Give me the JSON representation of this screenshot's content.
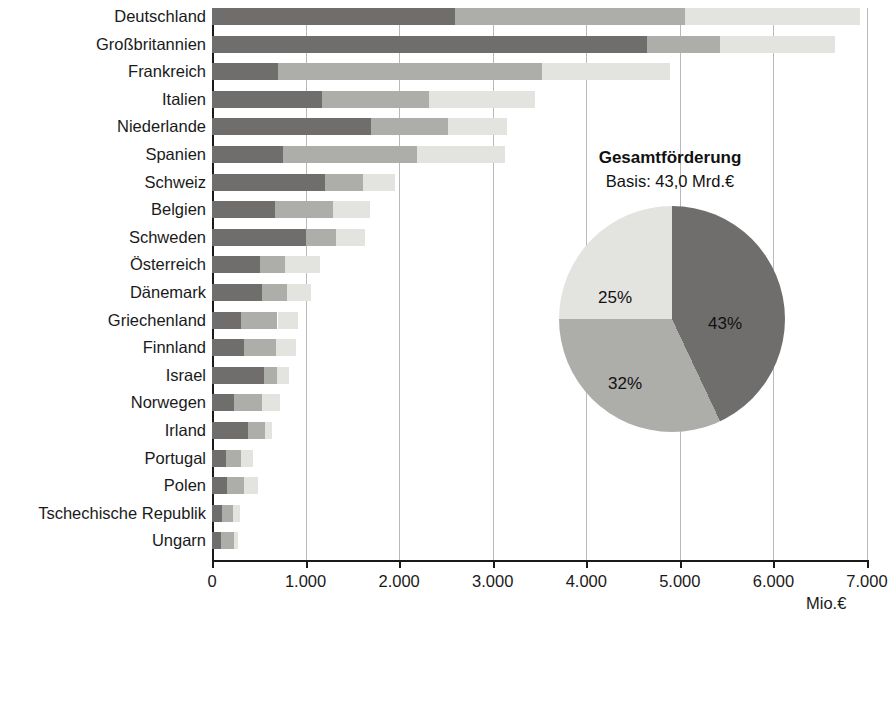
{
  "chart_data": {
    "type": "bar",
    "orientation": "horizontal",
    "stacked": true,
    "title": "",
    "xlabel": "Mio.€",
    "ylabel": "",
    "xlim": [
      0,
      7000
    ],
    "xticks": [
      0,
      1000,
      2000,
      3000,
      4000,
      5000,
      6000,
      7000
    ],
    "xtick_labels": [
      "0",
      "1.000",
      "2.000",
      "3.000",
      "4.000",
      "5.000",
      "6.000",
      "7.000"
    ],
    "grid": "vertical",
    "categories": [
      "Deutschland",
      "Großbritannien",
      "Frankreich",
      "Italien",
      "Niederlande",
      "Spanien",
      "Schweiz",
      "Belgien",
      "Schweden",
      "Österreich",
      "Dänemark",
      "Griechenland",
      "Finnland",
      "Israel",
      "Norwegen",
      "Irland",
      "Portugal",
      "Polen",
      "Tschechische Republik",
      "Ungarn"
    ],
    "series": [
      {
        "name": "Hochschulen",
        "color": "#706e6d",
        "values": [
          2600,
          4650,
          700,
          1180,
          1700,
          760,
          1210,
          675,
          1000,
          510,
          530,
          310,
          340,
          560,
          230,
          380,
          150,
          160,
          110,
          100
        ]
      },
      {
        "name": "Außeruniversitäre Einrichtungen und Personenförderung",
        "color": "#adadaa",
        "values": [
          2450,
          780,
          2830,
          1140,
          820,
          1430,
          400,
          615,
          320,
          275,
          270,
          390,
          340,
          130,
          300,
          190,
          160,
          180,
          110,
          130
        ]
      },
      {
        "name": "Industrie und Wirtschaft",
        "color": "#e3e3df",
        "values": [
          1870,
          1230,
          1360,
          1130,
          630,
          940,
          345,
          400,
          310,
          370,
          260,
          220,
          220,
          130,
          200,
          70,
          130,
          150,
          80,
          50
        ]
      }
    ],
    "totals": [
      6920,
      6660,
      4890,
      3450,
      3150,
      3130,
      1955,
      1690,
      1630,
      1155,
      1060,
      920,
      900,
      820,
      730,
      640,
      440,
      490,
      300,
      280
    ],
    "legend_position": "bottom-left",
    "inset_pie": {
      "type": "pie",
      "title": "Gesamtförderung",
      "subtitle": "Basis: 43,0 Mrd.€",
      "labels": [
        "43%",
        "32%",
        "25%"
      ],
      "values": [
        43,
        32,
        25
      ],
      "slice_names": [
        "Hochschulen",
        "Außeruniversitäre Einrichtungen und Personenförderung",
        "Industrie und Wirtschaft"
      ],
      "colors": [
        "#706e6d",
        "#adadaa",
        "#e3e3df"
      ]
    }
  },
  "legend": {
    "items": [
      {
        "label": "Hochschulen",
        "color": "#706e6d"
      },
      {
        "label": "Außeruniversitäre Einrichtungen und Personenförderung",
        "color": "#adadaa"
      },
      {
        "label": "Industrie und Wirtschaft",
        "color": "#e3e3df"
      }
    ]
  },
  "axis": {
    "unit_label": "Mio.€"
  }
}
